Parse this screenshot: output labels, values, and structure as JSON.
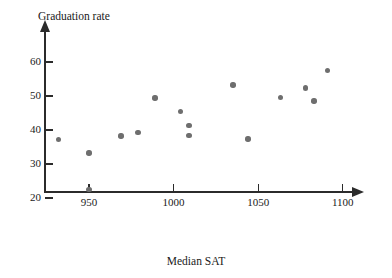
{
  "chart_data": {
    "type": "scatter",
    "title": "",
    "xlabel": "Median SAT",
    "ylabel": "Graduation rate",
    "xlim": [
      925,
      1108
    ],
    "ylim": [
      20,
      63
    ],
    "xticks": [
      950,
      1000,
      1050,
      1100
    ],
    "yticks": [
      20,
      30,
      40,
      50,
      60
    ],
    "grid": false,
    "legend": null,
    "marker_color": "#6e6e6e",
    "axis_color": "#2b2b2b",
    "points": [
      {
        "x": 932,
        "y": 37.2
      },
      {
        "x": 950,
        "y": 33.2
      },
      {
        "x": 950,
        "y": 22.5
      },
      {
        "x": 969,
        "y": 38.2
      },
      {
        "x": 979,
        "y": 39.3
      },
      {
        "x": 989,
        "y": 49.4
      },
      {
        "x": 1004,
        "y": 45.4
      },
      {
        "x": 1009,
        "y": 41.4
      },
      {
        "x": 1009,
        "y": 38.3
      },
      {
        "x": 1035,
        "y": 53.2
      },
      {
        "x": 1044,
        "y": 37.4
      },
      {
        "x": 1063,
        "y": 49.5
      },
      {
        "x": 1078,
        "y": 52.4
      },
      {
        "x": 1083,
        "y": 48.5
      },
      {
        "x": 1091,
        "y": 57.5
      }
    ]
  }
}
